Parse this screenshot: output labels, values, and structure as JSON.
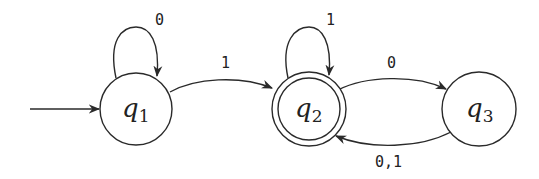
{
  "diagram": {
    "type": "finite-automaton",
    "start_state": "q1",
    "accept_states": [
      "q2"
    ],
    "states": [
      {
        "id": "q1",
        "base": "q",
        "sub": "1",
        "accepting": false
      },
      {
        "id": "q2",
        "base": "q",
        "sub": "2",
        "accepting": true
      },
      {
        "id": "q3",
        "base": "q",
        "sub": "3",
        "accepting": false
      }
    ],
    "transitions": [
      {
        "from": "q1",
        "to": "q1",
        "label": "0"
      },
      {
        "from": "q1",
        "to": "q2",
        "label": "1"
      },
      {
        "from": "q2",
        "to": "q2",
        "label": "1"
      },
      {
        "from": "q2",
        "to": "q3",
        "label": "0"
      },
      {
        "from": "q3",
        "to": "q2",
        "label": "0,1"
      }
    ],
    "colors": {
      "stroke": "#2a2a2a",
      "text": "#222222",
      "background": "#ffffff"
    }
  }
}
